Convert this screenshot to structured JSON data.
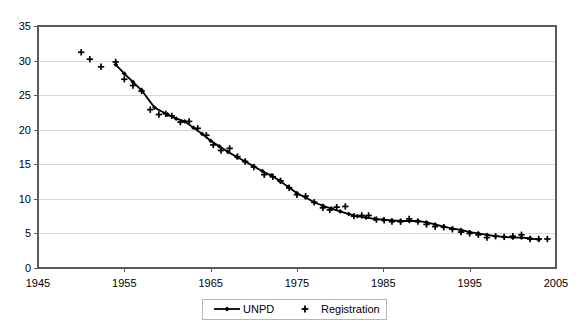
{
  "chart_data": {
    "type": "line",
    "title": "",
    "subtitle": "",
    "xlabel": "",
    "ylabel": "",
    "xlim": [
      1945,
      2005
    ],
    "ylim": [
      0,
      35
    ],
    "xticks": [
      "1945",
      "1955",
      "1965",
      "1975",
      "1985",
      "1995",
      "2005"
    ],
    "yticks": [
      "0",
      "5",
      "10",
      "15",
      "20",
      "25",
      "30",
      "35"
    ],
    "grid": "horizontal",
    "legend_position": "bottom",
    "legend": [
      {
        "name": "UNPD",
        "marker": "diamond",
        "line": true,
        "color": "#000000"
      },
      {
        "name": "Registration",
        "marker": "plus",
        "line": false,
        "color": "#000000"
      }
    ],
    "series": [
      {
        "name": "UNPD",
        "marker": "diamond",
        "points": [
          [
            1954.0,
            29.4
          ],
          [
            1955.0,
            28.1
          ],
          [
            1956.0,
            26.9
          ],
          [
            1957.0,
            25.7
          ],
          [
            1958.5,
            23.2
          ],
          [
            1960.0,
            22.2
          ],
          [
            1961.0,
            21.6
          ],
          [
            1962.0,
            21.2
          ],
          [
            1963.0,
            20.3
          ],
          [
            1964.0,
            19.4
          ],
          [
            1965.0,
            18.4
          ],
          [
            1966.0,
            17.6
          ],
          [
            1967.0,
            16.8
          ],
          [
            1968.0,
            16.1
          ],
          [
            1969.0,
            15.4
          ],
          [
            1970.0,
            14.7
          ],
          [
            1971.0,
            14.0
          ],
          [
            1972.0,
            13.4
          ],
          [
            1973.0,
            12.6
          ],
          [
            1974.0,
            11.7
          ],
          [
            1975.0,
            10.8
          ],
          [
            1976.0,
            10.2
          ],
          [
            1977.0,
            9.5
          ],
          [
            1978.0,
            9.0
          ],
          [
            1979.0,
            8.6
          ],
          [
            1980.0,
            8.2
          ],
          [
            1981.0,
            7.8
          ],
          [
            1982.0,
            7.5
          ],
          [
            1983.0,
            7.3
          ],
          [
            1984.0,
            7.1
          ],
          [
            1985.0,
            7.0
          ],
          [
            1986.0,
            6.9
          ],
          [
            1987.0,
            6.8
          ],
          [
            1988.0,
            6.8
          ],
          [
            1989.0,
            6.8
          ],
          [
            1990.0,
            6.6
          ],
          [
            1991.0,
            6.3
          ],
          [
            1992.0,
            6.0
          ],
          [
            1993.0,
            5.7
          ],
          [
            1994.0,
            5.5
          ],
          [
            1995.0,
            5.2
          ],
          [
            1996.0,
            5.0
          ],
          [
            1997.0,
            4.8
          ],
          [
            1998.0,
            4.6
          ],
          [
            1999.0,
            4.5
          ],
          [
            2000.0,
            4.4
          ],
          [
            2001.0,
            4.4
          ],
          [
            2002.0,
            4.3
          ],
          [
            2003.0,
            4.1
          ]
        ]
      },
      {
        "name": "Registration",
        "marker": "plus",
        "points": [
          [
            1950.0,
            31.2
          ],
          [
            1951.0,
            30.2
          ],
          [
            1952.3,
            29.1
          ],
          [
            1954.0,
            29.8
          ],
          [
            1955.0,
            27.3
          ],
          [
            1956.0,
            26.4
          ],
          [
            1957.0,
            25.6
          ],
          [
            1958.0,
            22.9
          ],
          [
            1959.0,
            22.2
          ],
          [
            1959.8,
            22.3
          ],
          [
            1960.5,
            22.0
          ],
          [
            1961.5,
            21.1
          ],
          [
            1962.5,
            21.2
          ],
          [
            1963.5,
            20.2
          ],
          [
            1964.5,
            19.2
          ],
          [
            1965.3,
            17.8
          ],
          [
            1966.2,
            17.0
          ],
          [
            1967.2,
            17.3
          ],
          [
            1968.1,
            16.1
          ],
          [
            1969.0,
            15.4
          ],
          [
            1970.0,
            14.6
          ],
          [
            1971.2,
            13.5
          ],
          [
            1972.2,
            13.2
          ],
          [
            1973.1,
            12.6
          ],
          [
            1974.1,
            11.6
          ],
          [
            1975.0,
            10.6
          ],
          [
            1976.0,
            10.4
          ],
          [
            1977.0,
            9.5
          ],
          [
            1978.0,
            8.7
          ],
          [
            1978.8,
            8.4
          ],
          [
            1979.6,
            8.8
          ],
          [
            1980.6,
            8.9
          ],
          [
            1981.6,
            7.5
          ],
          [
            1982.5,
            7.6
          ],
          [
            1983.3,
            7.6
          ],
          [
            1984.2,
            7.0
          ],
          [
            1985.1,
            6.9
          ],
          [
            1986.0,
            6.7
          ],
          [
            1987.0,
            6.7
          ],
          [
            1988.0,
            7.1
          ],
          [
            1989.0,
            6.7
          ],
          [
            1990.0,
            6.3
          ],
          [
            1991.0,
            6.0
          ],
          [
            1992.0,
            5.9
          ],
          [
            1993.0,
            5.6
          ],
          [
            1994.0,
            5.2
          ],
          [
            1995.0,
            5.0
          ],
          [
            1996.0,
            4.8
          ],
          [
            1997.0,
            4.4
          ],
          [
            1998.0,
            4.6
          ],
          [
            1999.0,
            4.5
          ],
          [
            2000.0,
            4.6
          ],
          [
            2001.0,
            4.8
          ],
          [
            2002.0,
            4.2
          ],
          [
            2003.0,
            4.2
          ],
          [
            2004.0,
            4.2
          ]
        ]
      }
    ]
  },
  "layout": {
    "plot_left": 38,
    "plot_top": 26,
    "plot_right": 556,
    "plot_bottom": 268,
    "legend_box": {
      "x": 202,
      "y": 299,
      "w": 184,
      "h": 20
    }
  }
}
